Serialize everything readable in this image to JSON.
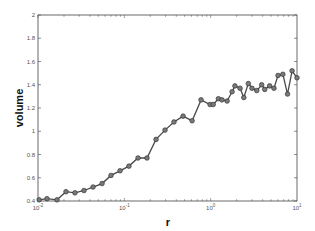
{
  "chart_data": {
    "type": "line",
    "title": "",
    "xlabel": "r",
    "ylabel": "volume",
    "xscale": "log",
    "xlim": [
      0.01,
      10
    ],
    "ylim": [
      0.4,
      2
    ],
    "grid": false,
    "legend": null,
    "x_ticks": [
      {
        "value": 0.01,
        "label": "10^-2"
      },
      {
        "value": 0.1,
        "label": "10^-1"
      },
      {
        "value": 1,
        "label": "10^0"
      },
      {
        "value": 10,
        "label": "10^1"
      }
    ],
    "y_ticks": [
      "0.4",
      "0.6",
      "0.8",
      "1",
      "1.2",
      "1.4",
      "1.6",
      "1.8",
      "2"
    ],
    "series": [
      {
        "name": "volume",
        "color": "#555555",
        "marker": "circle",
        "x": [
          0.0103,
          0.0127,
          0.0166,
          0.0211,
          0.0268,
          0.0341,
          0.0434,
          0.0552,
          0.0701,
          0.0892,
          0.113,
          0.144,
          0.183,
          0.233,
          0.296,
          0.376,
          0.479,
          0.609,
          0.774,
          0.984,
          1.07,
          1.23,
          1.35,
          1.55,
          1.77,
          1.91,
          2.19,
          2.42,
          2.73,
          3.01,
          3.42,
          3.9,
          4.23,
          4.82,
          5.41,
          6.03,
          6.86,
          7.77,
          8.77,
          10.0
        ],
        "values": [
          0.41,
          0.42,
          0.41,
          0.48,
          0.47,
          0.49,
          0.52,
          0.55,
          0.62,
          0.66,
          0.7,
          0.77,
          0.77,
          0.93,
          1.01,
          1.08,
          1.13,
          1.09,
          1.27,
          1.23,
          1.23,
          1.28,
          1.27,
          1.26,
          1.34,
          1.39,
          1.37,
          1.29,
          1.41,
          1.37,
          1.35,
          1.4,
          1.36,
          1.39,
          1.37,
          1.48,
          1.49,
          1.32,
          1.52,
          1.46
        ]
      }
    ]
  },
  "labels": {
    "xlabel": "r",
    "ylabel": "volume"
  }
}
